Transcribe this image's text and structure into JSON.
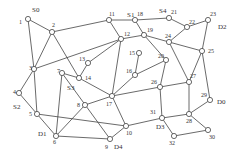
{
  "diagram": {
    "type": "network-graph",
    "nodes": [
      {
        "id": "1",
        "x": 28,
        "y": 19,
        "lx": -9,
        "ly": 5
      },
      {
        "id": "2",
        "x": 52,
        "y": 32,
        "lx": 0,
        "ly": -5
      },
      {
        "id": "3",
        "x": 34,
        "y": 69,
        "lx": -5,
        "ly": 1
      },
      {
        "id": "4",
        "x": 19,
        "y": 93,
        "lx": -6,
        "ly": 1
      },
      {
        "id": "5",
        "x": 37,
        "y": 114,
        "lx": -8,
        "ly": 2
      },
      {
        "id": "6",
        "x": 56,
        "y": 136,
        "lx": -3,
        "ly": 8
      },
      {
        "id": "7",
        "x": 62,
        "y": 73,
        "lx": -5,
        "ly": 0
      },
      {
        "id": "8",
        "x": 85,
        "y": 105,
        "lx": -8,
        "ly": 2
      },
      {
        "id": "9",
        "x": 110,
        "y": 139,
        "lx": -5,
        "ly": 10
      },
      {
        "id": "10",
        "x": 126,
        "y": 126,
        "lx": 0,
        "ly": 9
      },
      {
        "id": "11",
        "x": 109,
        "y": 20,
        "lx": 0,
        "ly": -4
      },
      {
        "id": "12",
        "x": 121,
        "y": 39,
        "lx": 3,
        "ly": -3
      },
      {
        "id": "13",
        "x": 88,
        "y": 63,
        "lx": -9,
        "ly": -2
      },
      {
        "id": "14",
        "x": 79,
        "y": 78,
        "lx": 6,
        "ly": 2
      },
      {
        "id": "15",
        "x": 139,
        "y": 53,
        "lx": -10,
        "ly": 2
      },
      {
        "id": "16",
        "x": 135,
        "y": 75,
        "lx": -9,
        "ly": -2
      },
      {
        "id": "17",
        "x": 112,
        "y": 96,
        "lx": -6,
        "ly": 10
      },
      {
        "id": "18",
        "x": 135,
        "y": 20,
        "lx": 2,
        "ly": -4
      },
      {
        "id": "19",
        "x": 144,
        "y": 35,
        "lx": 3,
        "ly": -3
      },
      {
        "id": "20",
        "x": 166,
        "y": 60,
        "lx": -8,
        "ly": -2
      },
      {
        "id": "21",
        "x": 169,
        "y": 18,
        "lx": 2,
        "ly": -4
      },
      {
        "id": "22",
        "x": 187,
        "y": 27,
        "lx": 2,
        "ly": -3
      },
      {
        "id": "23",
        "x": 208,
        "y": 20,
        "lx": 2,
        "ly": -4
      },
      {
        "id": "24",
        "x": 169,
        "y": 42,
        "lx": -4,
        "ly": -4
      },
      {
        "id": "25",
        "x": 202,
        "y": 51,
        "lx": 6,
        "ly": 2
      },
      {
        "id": "26",
        "x": 160,
        "y": 87,
        "lx": -9,
        "ly": -3
      },
      {
        "id": "27",
        "x": 189,
        "y": 82,
        "lx": 1,
        "ly": -4
      },
      {
        "id": "28",
        "x": 189,
        "y": 114,
        "lx": -3,
        "ly": 9
      },
      {
        "id": "29",
        "x": 210,
        "y": 100,
        "lx": -9,
        "ly": -3
      },
      {
        "id": "30",
        "x": 208,
        "y": 130,
        "lx": 1,
        "ly": 9
      },
      {
        "id": "31",
        "x": 162,
        "y": 118,
        "lx": -12,
        "ly": -4
      },
      {
        "id": "32",
        "x": 174,
        "y": 136,
        "lx": -5,
        "ly": 9
      }
    ],
    "edges": [
      [
        "1",
        "2"
      ],
      [
        "1",
        "3"
      ],
      [
        "2",
        "11"
      ],
      [
        "2",
        "3"
      ],
      [
        "2",
        "14"
      ],
      [
        "3",
        "12"
      ],
      [
        "3",
        "5"
      ],
      [
        "4",
        "3"
      ],
      [
        "4",
        "5"
      ],
      [
        "5",
        "6"
      ],
      [
        "5",
        "10"
      ],
      [
        "7",
        "14"
      ],
      [
        "7",
        "6"
      ],
      [
        "7",
        "9"
      ],
      [
        "8",
        "6"
      ],
      [
        "8",
        "17"
      ],
      [
        "11",
        "18"
      ],
      [
        "11",
        "12"
      ],
      [
        "12",
        "13"
      ],
      [
        "12",
        "19"
      ],
      [
        "12",
        "17"
      ],
      [
        "13",
        "14"
      ],
      [
        "14",
        "17"
      ],
      [
        "15",
        "16"
      ],
      [
        "16",
        "20"
      ],
      [
        "16",
        "17"
      ],
      [
        "17",
        "26"
      ],
      [
        "17",
        "10"
      ],
      [
        "18",
        "21"
      ],
      [
        "18",
        "19"
      ],
      [
        "19",
        "20"
      ],
      [
        "19",
        "24"
      ],
      [
        "20",
        "26"
      ],
      [
        "21",
        "22"
      ],
      [
        "22",
        "23"
      ],
      [
        "22",
        "24"
      ],
      [
        "23",
        "25"
      ],
      [
        "24",
        "27"
      ],
      [
        "24",
        "25"
      ],
      [
        "25",
        "29"
      ],
      [
        "25",
        "27"
      ],
      [
        "26",
        "27"
      ],
      [
        "26",
        "31"
      ],
      [
        "27",
        "28"
      ],
      [
        "28",
        "29"
      ],
      [
        "28",
        "30"
      ],
      [
        "28",
        "31"
      ],
      [
        "30",
        "32"
      ],
      [
        "31",
        "32"
      ],
      [
        "31",
        "10"
      ],
      [
        "9",
        "10"
      ],
      [
        "6",
        "9"
      ]
    ],
    "terminal_labels": [
      {
        "text": "S0",
        "x": 32,
        "y": 12
      },
      {
        "text": "S1",
        "x": 127,
        "y": 17
      },
      {
        "text": "S4",
        "x": 159,
        "y": 13
      },
      {
        "text": "D2",
        "x": 218,
        "y": 29
      },
      {
        "text": "S3",
        "x": 67,
        "y": 90
      },
      {
        "text": "S2",
        "x": 13,
        "y": 109
      },
      {
        "text": "D1",
        "x": 38,
        "y": 136
      },
      {
        "text": "D4",
        "x": 114,
        "y": 149
      },
      {
        "text": "D0",
        "x": 217,
        "y": 104
      },
      {
        "text": "D3",
        "x": 156,
        "y": 129
      }
    ]
  }
}
